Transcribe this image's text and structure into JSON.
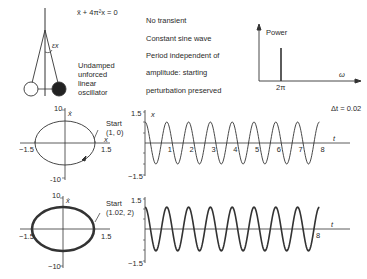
{
  "pendulum": {
    "equation": "ẍ + 4π²x = 0",
    "angle_label": "εx",
    "caption": [
      "Undamped",
      "unforced",
      "linear",
      "oscillator"
    ]
  },
  "properties": [
    "No transient",
    "Constant sine wave",
    "Period independent of",
    "amplitude: starting",
    "perturbation preserved"
  ],
  "spectrum": {
    "ylabel": "Power",
    "xlabel": "ω",
    "peak_label": "2π"
  },
  "timestep": "Δt = 0.02",
  "chart_data": [
    {
      "type": "line",
      "title": "Phase portrait (start 1, 0)",
      "xlabel": "x",
      "ylabel": "ẋ",
      "xlim": [
        -1.5,
        1.5
      ],
      "ylim": [
        -10,
        10
      ],
      "tick_labels": {
        "x": [
          "-1.5",
          "1.5"
        ],
        "y": [
          "10",
          "-10"
        ]
      },
      "annotation": {
        "text": "Start",
        "coords": "(1, 0)"
      },
      "series": [
        {
          "name": "trajectory",
          "shape": "ellipse",
          "x_amplitude": 1.0,
          "y_amplitude": 6.28
        }
      ]
    },
    {
      "type": "line",
      "title": "x vs t (start 1, 0)",
      "xlabel": "t",
      "ylabel": "x",
      "ylim": [
        -1.5,
        1.5
      ],
      "x_ticks": [
        "1",
        "2",
        "3",
        "4",
        "5",
        "6",
        "7",
        "8"
      ],
      "y_ticks": [
        "1.5",
        "-1.5"
      ],
      "series": [
        {
          "name": "x(t)",
          "function": "cos(2πt)",
          "amplitude": 1.0,
          "period": 1.0,
          "t_range": [
            0,
            8
          ]
        }
      ]
    },
    {
      "type": "line",
      "title": "Phase portrait (start 1.02, 2)",
      "xlabel": "x",
      "ylabel": "ẋ",
      "xlim": [
        -1.5,
        1.5
      ],
      "ylim": [
        -10,
        10
      ],
      "tick_labels": {
        "x": [
          "-1.5",
          "1.5"
        ],
        "y": [
          "10",
          "-10"
        ]
      },
      "annotation": {
        "text": "Start",
        "coords": "(1.02, 2)"
      },
      "series": [
        {
          "name": "trajectory",
          "shape": "ellipse (thick, slightly larger)",
          "x_amplitude": 1.04,
          "y_amplitude": 6.5
        }
      ]
    },
    {
      "type": "line",
      "title": "x vs t (start 1.02, 2)",
      "xlabel": "t",
      "ylabel": "x",
      "ylim": [
        -1.5,
        1.5
      ],
      "x_ticks": [
        "8"
      ],
      "y_ticks": [
        "1.5",
        "-1.5"
      ],
      "series": [
        {
          "name": "x(t)",
          "function": "≈cos(2πt)",
          "amplitude": 1.04,
          "period": 1.0,
          "t_range": [
            0,
            8
          ]
        }
      ]
    }
  ],
  "labels": {
    "p1": {
      "y_top": "10",
      "y_bot": "-10",
      "x_left": "−1.5",
      "x_right": "1.5",
      "xvar": "x",
      "yvar": "ẋ",
      "start": "Start",
      "start_coords": "(1, 0)"
    },
    "ts1": {
      "y_top": "1.5",
      "y_bot": "−1.5",
      "xvar": "x",
      "tvar": "t",
      "ticks": [
        "1",
        "2",
        "3",
        "4",
        "5",
        "6",
        "7",
        "8"
      ]
    },
    "p2": {
      "y_top": "10",
      "y_bot": "−10",
      "x_left": "−1.5",
      "x_right": "1.5",
      "yvar": "ẋ",
      "start": "Start",
      "start_coords": "(1.02, 2)"
    },
    "ts2": {
      "y_top": "1.5",
      "y_bot": "−1.5",
      "xvar": "x",
      "tvar": "t",
      "tick8": "8"
    }
  }
}
